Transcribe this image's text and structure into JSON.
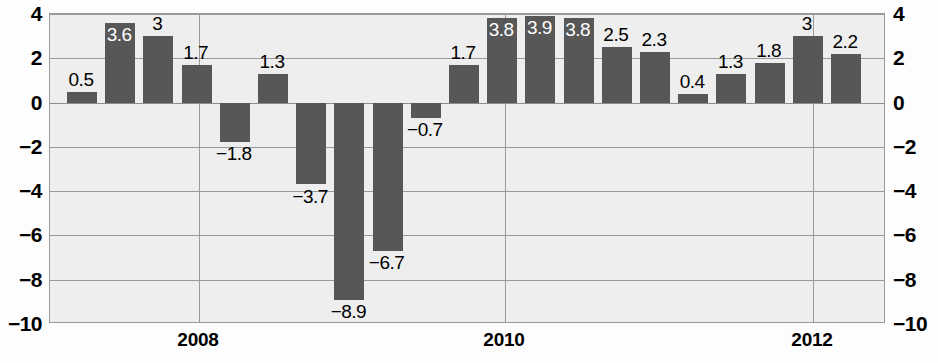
{
  "chart_data": {
    "type": "bar",
    "title": "",
    "subtitle": "",
    "xlabel": "",
    "ylabel": "",
    "ylim": [
      -10,
      4
    ],
    "grid": true,
    "legend": null,
    "categories": [
      "2007 Q3",
      "2007 Q4",
      "2008 Q1",
      "2008 Q2",
      "2008 Q3",
      "2008 Q4",
      "2009 Q1",
      "2009 Q2",
      "2009 Q3",
      "2009 Q4",
      "2010 Q1",
      "2010 Q2",
      "2010 Q3",
      "2010 Q4",
      "2011 Q1",
      "2011 Q2",
      "2011 Q3",
      "2011 Q4",
      "2012 Q1",
      "2012 Q2",
      "2012 Q3"
    ],
    "values": [
      0.5,
      3.6,
      3,
      1.7,
      -1.8,
      1.3,
      -3.7,
      -8.9,
      -6.7,
      -0.7,
      1.7,
      3.8,
      3.9,
      3.8,
      2.5,
      2.3,
      0.4,
      1.3,
      1.8,
      3,
      2.2
    ],
    "value_labels": [
      "0.5",
      "3.6",
      "3",
      "1.7",
      "−1.8",
      "1.3",
      "−3.7",
      "−8.9",
      "−6.7",
      "−0.7",
      "1.7",
      "3.8",
      "3.9",
      "3.8",
      "2.5",
      "2.3",
      "0.4",
      "1.3",
      "1.8",
      "3",
      "2.2"
    ],
    "label_placement": [
      "outside",
      "inside",
      "outside",
      "outside",
      "outside",
      "outside",
      "outside",
      "outside",
      "outside",
      "outside",
      "outside",
      "inside",
      "inside",
      "inside",
      "outside",
      "outside",
      "outside",
      "outside",
      "outside",
      "outside",
      "outside"
    ],
    "y_ticks": [
      4,
      2,
      0,
      -2,
      -4,
      -6,
      -8,
      -10
    ],
    "y_tick_labels": [
      "4",
      "2",
      "0",
      "−2",
      "−4",
      "−6",
      "−8",
      "−10"
    ],
    "y_axis_both_sides": true,
    "x_tick_labels": [
      "2008",
      "2010",
      "2012"
    ],
    "x_tick_positions": [
      198,
      504,
      812
    ],
    "colors": {
      "bar": "#575757",
      "plot_background": "#eeeeee",
      "gridline": "#9a9a9a",
      "axis_text": "#000000",
      "inside_label_text": "#ffffff"
    }
  }
}
